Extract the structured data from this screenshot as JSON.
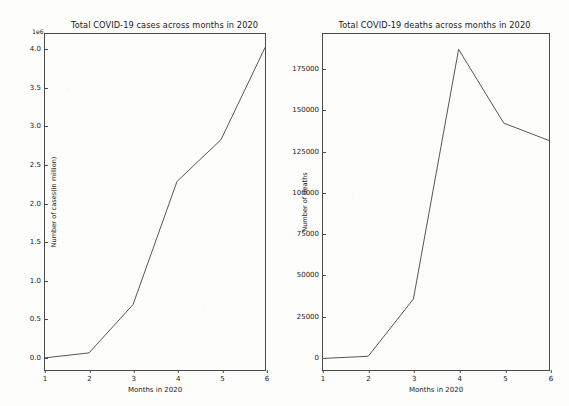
{
  "figure": {
    "background_color": "#fdfdfc",
    "line_color": "#555555",
    "axis_color": "#4a4a4a",
    "text_color": "#1a1a1a"
  },
  "charts": [
    {
      "id": "cases",
      "title": "Total COVID-19 cases across months in 2020",
      "offset_text": "1e6",
      "xlabel": "Months in 2020",
      "ylabel": "Number of cases(in million)",
      "xticks": [
        "1",
        "2",
        "3",
        "4",
        "5",
        "6"
      ],
      "yticks": [
        "0.0",
        "0.5",
        "1.0",
        "1.5",
        "2.0",
        "2.5",
        "3.0",
        "3.5",
        "4.0"
      ]
    },
    {
      "id": "deaths",
      "title": "Total COVID-19 deaths across months in 2020",
      "offset_text": "",
      "xlabel": "Months in 2020",
      "ylabel": "Number of deaths",
      "xticks": [
        "1",
        "2",
        "3",
        "4",
        "5",
        "6"
      ],
      "yticks": [
        "0",
        "25000",
        "50000",
        "75000",
        "100000",
        "125000",
        "150000",
        "175000"
      ]
    }
  ],
  "chart_data": [
    {
      "type": "line",
      "title": "Total COVID-19 cases across months in 2020",
      "xlabel": "Months in 2020",
      "ylabel": "Number of cases(in million)",
      "y_offset_multiplier": "1e6",
      "x": [
        1,
        2,
        3,
        4,
        5,
        6
      ],
      "x_tick_labels": [
        "1",
        "2",
        "3",
        "4",
        "5",
        "6"
      ],
      "y_tick_labels": [
        "0.0",
        "0.5",
        "1.0",
        "1.5",
        "2.0",
        "2.5",
        "3.0",
        "3.5",
        "4.0"
      ],
      "y_tick_values": [
        0,
        500000,
        1000000,
        1500000,
        2000000,
        2500000,
        3000000,
        3500000,
        4000000
      ],
      "series": [
        {
          "name": "Total cases",
          "values": [
            20000,
            85000,
            720000,
            2340000,
            2890000,
            4100000
          ]
        }
      ],
      "xlim": [
        1,
        6
      ],
      "ylim": [
        -140000,
        4280000
      ],
      "grid": false,
      "legend": "none",
      "marker": "none"
    },
    {
      "type": "line",
      "title": "Total COVID-19 deaths across months in 2020",
      "xlabel": "Months in 2020",
      "ylabel": "Number of deaths",
      "x": [
        1,
        2,
        3,
        4,
        5,
        6
      ],
      "x_tick_labels": [
        "1",
        "2",
        "3",
        "4",
        "5",
        "6"
      ],
      "y_tick_labels": [
        "0",
        "25000",
        "50000",
        "75000",
        "100000",
        "125000",
        "150000",
        "175000"
      ],
      "y_tick_values": [
        0,
        25000,
        50000,
        75000,
        100000,
        125000,
        150000,
        175000
      ],
      "series": [
        {
          "name": "Total deaths",
          "values": [
            500,
            1800,
            36500,
            187700,
            143000,
            132500
          ]
        }
      ],
      "xlim": [
        1,
        6
      ],
      "ylim": [
        -6500,
        197000
      ],
      "grid": false,
      "legend": "none",
      "marker": "none"
    }
  ]
}
